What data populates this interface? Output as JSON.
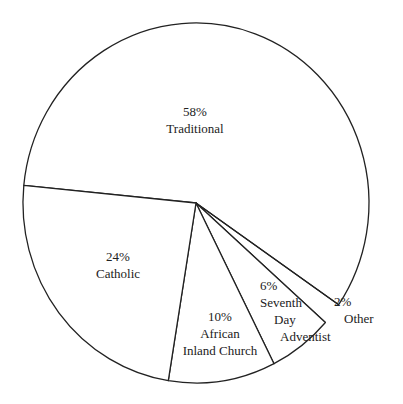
{
  "chart_data": {
    "type": "pie",
    "title": "",
    "categories": [
      "Traditional",
      "Catholic",
      "African Inland Church",
      "Seventh Day Adventist",
      "Other"
    ],
    "values": [
      58,
      24,
      10,
      6,
      2
    ],
    "unit": "%",
    "labels": [
      {
        "pct": "58%",
        "lines": [
          "Traditional"
        ]
      },
      {
        "pct": "24%",
        "lines": [
          "Catholic"
        ]
      },
      {
        "pct": "10%",
        "lines": [
          "African",
          "Inland Church"
        ]
      },
      {
        "pct": "6%",
        "lines": [
          "Seventh",
          "Day",
          "Adventist"
        ]
      },
      {
        "pct": "2%",
        "lines": [
          "Other"
        ]
      }
    ],
    "legend": "none",
    "colors": {
      "fill": "#ffffff",
      "stroke": "#222222"
    }
  }
}
